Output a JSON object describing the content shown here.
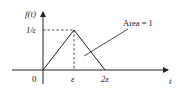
{
  "diagram": {
    "y_axis_label": "f(t)",
    "x_axis_label": "t",
    "peak_label": "1/ε",
    "ticks": {
      "origin": "0",
      "eps": "ε",
      "two_eps": "2ε"
    },
    "annotation": "Area = 1",
    "colors": {
      "stroke": "#222222",
      "background": "#ffffff"
    }
  }
}
